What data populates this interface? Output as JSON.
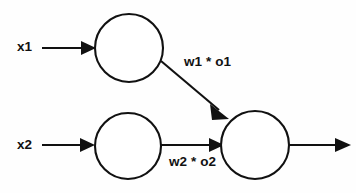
{
  "diagram": {
    "background_color": "#fefefe",
    "stroke_color": "#111111",
    "inputs": [
      {
        "id": "x1",
        "label": "x1"
      },
      {
        "id": "x2",
        "label": "x2"
      }
    ],
    "nodes": [
      {
        "id": "hidden-1",
        "cx": 129,
        "cy": 48,
        "r": 34,
        "label": ""
      },
      {
        "id": "hidden-2",
        "cx": 128,
        "cy": 146,
        "r": 33,
        "label": ""
      },
      {
        "id": "output",
        "cx": 255,
        "cy": 145,
        "r": 34,
        "label": ""
      }
    ],
    "edges": [
      {
        "id": "w1",
        "label": "w1 * o1",
        "from": "hidden-1",
        "to": "output"
      },
      {
        "id": "w2",
        "label": "w2 * o2",
        "from": "hidden-2",
        "to": "output"
      }
    ]
  }
}
